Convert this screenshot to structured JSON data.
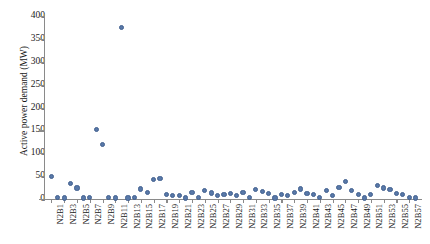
{
  "chart_data": {
    "type": "scatter",
    "title": "",
    "xlabel": "",
    "ylabel": "Active power demand (MW)",
    "ylim": [
      0,
      400
    ],
    "ytick_labels": [
      "0",
      "50",
      "100",
      "150",
      "200",
      "250",
      "300",
      "350",
      "400"
    ],
    "ytick_values": [
      0,
      50,
      100,
      150,
      200,
      250,
      300,
      350,
      400
    ],
    "grid": false,
    "legend": "none",
    "marker_color": "#5878a8",
    "axis_color": "#8a8a8a",
    "xtick_labels": [
      "N2B1",
      "N2B3",
      "N2B5",
      "N2B7",
      "N2B9",
      "N2B11",
      "N2B13",
      "N2B15",
      "N2B17",
      "N2B19",
      "N2B21",
      "N2B23",
      "N2B25",
      "N2B27",
      "N2B29",
      "N2B31",
      "N2B33",
      "N2B35",
      "N2B37",
      "N2B39",
      "N2B41",
      "N2B43",
      "N2B45",
      "N2B47",
      "N2B49",
      "N2B51",
      "N2B53",
      "N2B55",
      "N2B57"
    ],
    "categories": [
      "N2B1",
      "N2B2",
      "N2B3",
      "N2B4",
      "N2B5",
      "N2B6",
      "N2B7",
      "N2B8",
      "N2B9",
      "N2B10",
      "N2B11",
      "N2B12",
      "N2B13",
      "N2B14",
      "N2B15",
      "N2B16",
      "N2B17",
      "N2B18",
      "N2B19",
      "N2B20",
      "N2B21",
      "N2B22",
      "N2B23",
      "N2B24",
      "N2B25",
      "N2B26",
      "N2B27",
      "N2B28",
      "N2B29",
      "N2B30",
      "N2B31",
      "N2B32",
      "N2B33",
      "N2B34",
      "N2B35",
      "N2B36",
      "N2B37",
      "N2B38",
      "N2B39",
      "N2B40",
      "N2B41",
      "N2B42",
      "N2B43",
      "N2B44",
      "N2B45",
      "N2B46",
      "N2B47",
      "N2B48",
      "N2B49",
      "N2B50",
      "N2B51",
      "N2B52",
      "N2B53",
      "N2B54",
      "N2B55",
      "N2B56",
      "N2B57",
      "N2B58"
    ],
    "values": [
      50,
      4,
      2,
      34,
      24,
      2,
      3,
      152,
      120,
      3,
      2,
      375,
      2,
      3,
      22,
      14,
      42,
      45,
      10,
      8,
      7,
      2,
      15,
      3,
      18,
      13,
      7,
      10,
      12,
      8,
      15,
      4,
      20,
      16,
      12,
      2,
      10,
      7,
      15,
      22,
      12,
      9,
      3,
      18,
      8,
      25,
      38,
      18,
      10,
      2,
      10,
      30,
      24,
      20,
      12,
      9,
      4,
      2
    ],
    "values_note": "Active power demand per bus, MW"
  }
}
